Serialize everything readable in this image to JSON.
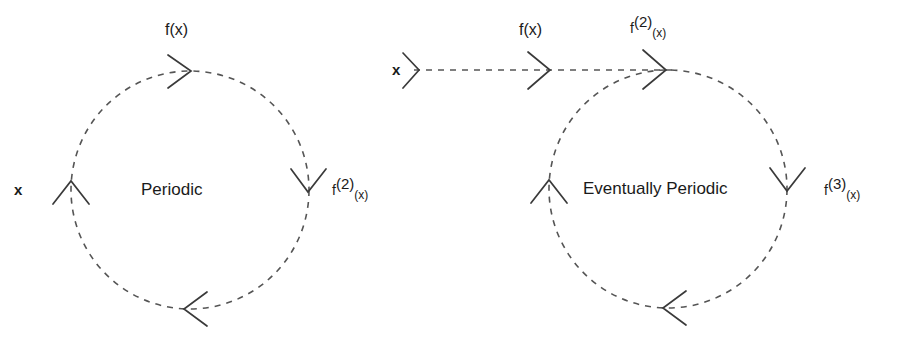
{
  "figure": {
    "background_color": "#ffffff",
    "stroke_color": "#555555",
    "text_color": "#1a1a1a",
    "dash_pattern": "6 6"
  },
  "diagrams": [
    {
      "id": "periodic",
      "center_label": "Periodic",
      "circle": {
        "cx": 190,
        "cy": 190,
        "r": 119
      },
      "labels": {
        "start": "x",
        "top": "f(x)",
        "right_base": "f",
        "right_sup": "(2)",
        "right_arg": "(x)"
      },
      "arrowheads": [
        {
          "name": "arrowhead-top",
          "x": 186,
          "y": 71,
          "angle": 0
        },
        {
          "name": "arrowhead-right",
          "x": 309,
          "y": 190,
          "angle": 90
        },
        {
          "name": "arrowhead-bottom",
          "x": 186,
          "y": 309,
          "angle": 180
        },
        {
          "name": "arrowhead-left",
          "x": 71,
          "y": 190,
          "angle": 270
        }
      ]
    },
    {
      "id": "eventually-periodic",
      "center_label": "Eventually Periodic",
      "circle": {
        "cx": 668,
        "cy": 189,
        "r": 119
      },
      "labels": {
        "start": "x",
        "top_first": "f(x)",
        "top_second_base": "f",
        "top_second_sup": "(2)",
        "top_second_arg": "(x)",
        "right_base": "f",
        "right_sup": "(3)",
        "right_arg": "(x)"
      },
      "entry_line": {
        "x1": 414,
        "y1": 70,
        "x2": 668,
        "y2": 70
      },
      "arrowheads": [
        {
          "name": "arrowhead-entry-start",
          "x": 418,
          "y": 70,
          "angle": 90
        },
        {
          "name": "arrowhead-entry-mid",
          "x": 548,
          "y": 70,
          "angle": 90
        },
        {
          "name": "arrowhead-top",
          "x": 664,
          "y": 70,
          "angle": 90
        },
        {
          "name": "arrowhead-right",
          "x": 787,
          "y": 189,
          "angle": 180
        },
        {
          "name": "arrowhead-bottom",
          "x": 664,
          "y": 308,
          "angle": 270
        },
        {
          "name": "arrowhead-left",
          "x": 549,
          "y": 189,
          "angle": 0
        }
      ]
    }
  ]
}
